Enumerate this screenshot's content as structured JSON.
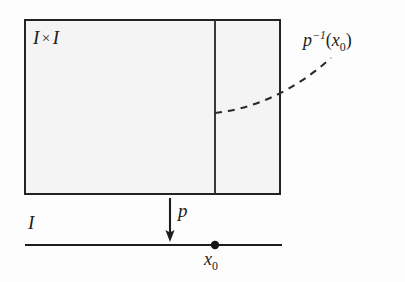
{
  "figure": {
    "caption": "Product square I x I projecting onto the interval I, with the fiber over the point x0 drawn as a dashed curve."
  },
  "colors": {
    "ink": "#1d1d1d",
    "square_fill": "#f4f4f4",
    "square_stroke": "#242424",
    "page_background": "#fdfdfd",
    "dashed_stroke": "#2a2a2a",
    "baseline_stroke": "#1d1d1d"
  },
  "labels": {
    "square": {
      "left_symbol": "I",
      "operator": "×",
      "right_symbol": "I"
    },
    "fiber": {
      "base": "p",
      "exponent": "−1",
      "open_paren": "(",
      "argument": "x",
      "subscript": "0",
      "close_paren": ")"
    },
    "projection": {
      "symbol": "p"
    },
    "interval": {
      "symbol": "I"
    },
    "basepoint": {
      "symbol": "x",
      "subscript": "0"
    }
  },
  "geometry": {
    "square": {
      "x": 25,
      "y": 20,
      "width": 255,
      "height": 174
    },
    "fiber_line_x": 215,
    "dashed_curve": {
      "start": [
        215,
        113
      ],
      "control": [
        275,
        104
      ],
      "end": [
        331,
        58
      ]
    },
    "projection_arrow": {
      "x": 170,
      "y_start": 198,
      "y_end": 241
    },
    "baseline": {
      "x_start": 25,
      "x_end": 282,
      "y": 245
    },
    "basepoint_dot": {
      "cx": 215,
      "cy": 245,
      "r": 4
    }
  }
}
